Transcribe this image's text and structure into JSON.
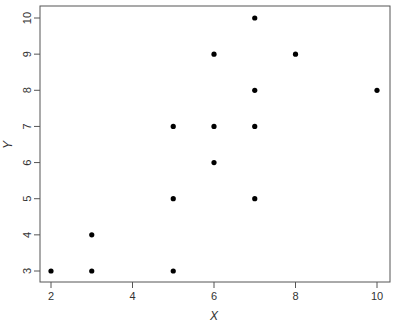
{
  "chart_data": {
    "type": "scatter",
    "title": "",
    "xlabel": "X",
    "ylabel": "Y",
    "xlim": [
      2,
      10
    ],
    "ylim": [
      3,
      10
    ],
    "x_ticks": [
      2,
      4,
      6,
      8,
      10
    ],
    "y_ticks": [
      3,
      4,
      5,
      6,
      7,
      8,
      9,
      10
    ],
    "grid": false,
    "legend": null,
    "series": [
      {
        "name": "points",
        "color": "#000000",
        "points": [
          {
            "x": 2,
            "y": 3
          },
          {
            "x": 3,
            "y": 3
          },
          {
            "x": 3,
            "y": 4
          },
          {
            "x": 5,
            "y": 3
          },
          {
            "x": 5,
            "y": 5
          },
          {
            "x": 5,
            "y": 7
          },
          {
            "x": 6,
            "y": 6
          },
          {
            "x": 6,
            "y": 7
          },
          {
            "x": 6,
            "y": 9
          },
          {
            "x": 7,
            "y": 5
          },
          {
            "x": 7,
            "y": 7
          },
          {
            "x": 7,
            "y": 8
          },
          {
            "x": 7,
            "y": 10
          },
          {
            "x": 8,
            "y": 9
          },
          {
            "x": 10,
            "y": 8
          }
        ]
      }
    ]
  },
  "colors": {
    "frame": "#555555",
    "text": "#333333",
    "points": "#000000",
    "background": "#ffffff"
  }
}
